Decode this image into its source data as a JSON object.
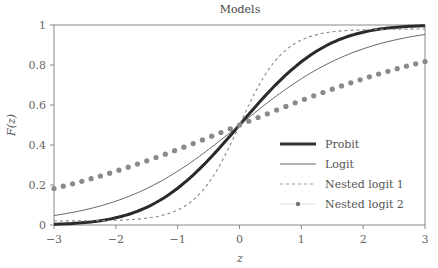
{
  "chart_data": {
    "type": "line",
    "title": "Models",
    "xlabel": "z",
    "ylabel": "F(z)",
    "xlim": [
      -3,
      3
    ],
    "ylim": [
      0,
      1
    ],
    "xticks": [
      "−3",
      "−2",
      "−1",
      "0",
      "1",
      "2",
      "3"
    ],
    "yticks": [
      "0",
      "0.2",
      "0.4",
      "0.6",
      "0.8",
      "1"
    ],
    "grid": false,
    "legend_position": "lower right",
    "x": [
      -3,
      -2.5,
      -2,
      -1.5,
      -1,
      -0.5,
      0,
      0.5,
      1,
      1.5,
      2,
      2.5,
      3
    ],
    "series": [
      {
        "name": "Probit",
        "style": "thick-solid",
        "color": "#333333",
        "values": [
          0.003,
          0.012,
          0.036,
          0.089,
          0.184,
          0.326,
          0.5,
          0.674,
          0.816,
          0.911,
          0.964,
          0.988,
          0.997
        ]
      },
      {
        "name": "Logit",
        "style": "thin-solid",
        "color": "#555555",
        "values": [
          0.047,
          0.076,
          0.119,
          0.182,
          0.269,
          0.378,
          0.5,
          0.622,
          0.731,
          0.818,
          0.881,
          0.924,
          0.953
        ]
      },
      {
        "name": "Nested logit 1",
        "style": "dashed",
        "color": "#888888",
        "values": [
          0.02,
          0.021,
          0.024,
          0.034,
          0.078,
          0.21,
          0.5,
          0.79,
          0.922,
          0.966,
          0.976,
          0.979,
          0.98
        ]
      },
      {
        "name": "Nested logit 2",
        "style": "dotted-markers",
        "color": "#888888",
        "values": [
          0.182,
          0.223,
          0.269,
          0.321,
          0.378,
          0.438,
          0.5,
          0.562,
          0.622,
          0.679,
          0.731,
          0.777,
          0.818
        ]
      }
    ]
  },
  "legend": {
    "items": [
      "Probit",
      "Logit",
      "Nested logit 1",
      "Nested logit 2"
    ]
  }
}
